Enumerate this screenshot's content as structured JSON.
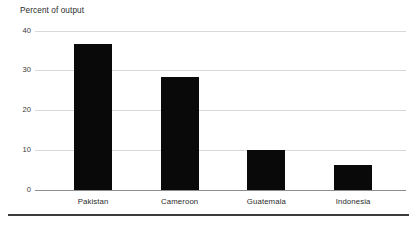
{
  "chart_data": {
    "type": "bar",
    "title": "Percent of output",
    "xlabel": "",
    "ylabel": "Percent of output",
    "categories": [
      "Pakistan",
      "Cameroon",
      "Guatemala",
      "Indonesia"
    ],
    "values": [
      36.8,
      28.5,
      10.0,
      6.3
    ],
    "ylim": [
      0,
      40
    ],
    "yticks": [
      0,
      10,
      20,
      30,
      40
    ],
    "ytick_labels": [
      "0",
      "10",
      "20",
      "30",
      "40"
    ],
    "grid": true,
    "legend": false,
    "legend_position": "none",
    "bar_color": "#090909",
    "gridline_color": "#d9d9d9",
    "axis_color": "#8c8c8c",
    "background_color": "#ffffff"
  },
  "figure": {
    "bottom_rule_color": "#3b3b3b"
  }
}
